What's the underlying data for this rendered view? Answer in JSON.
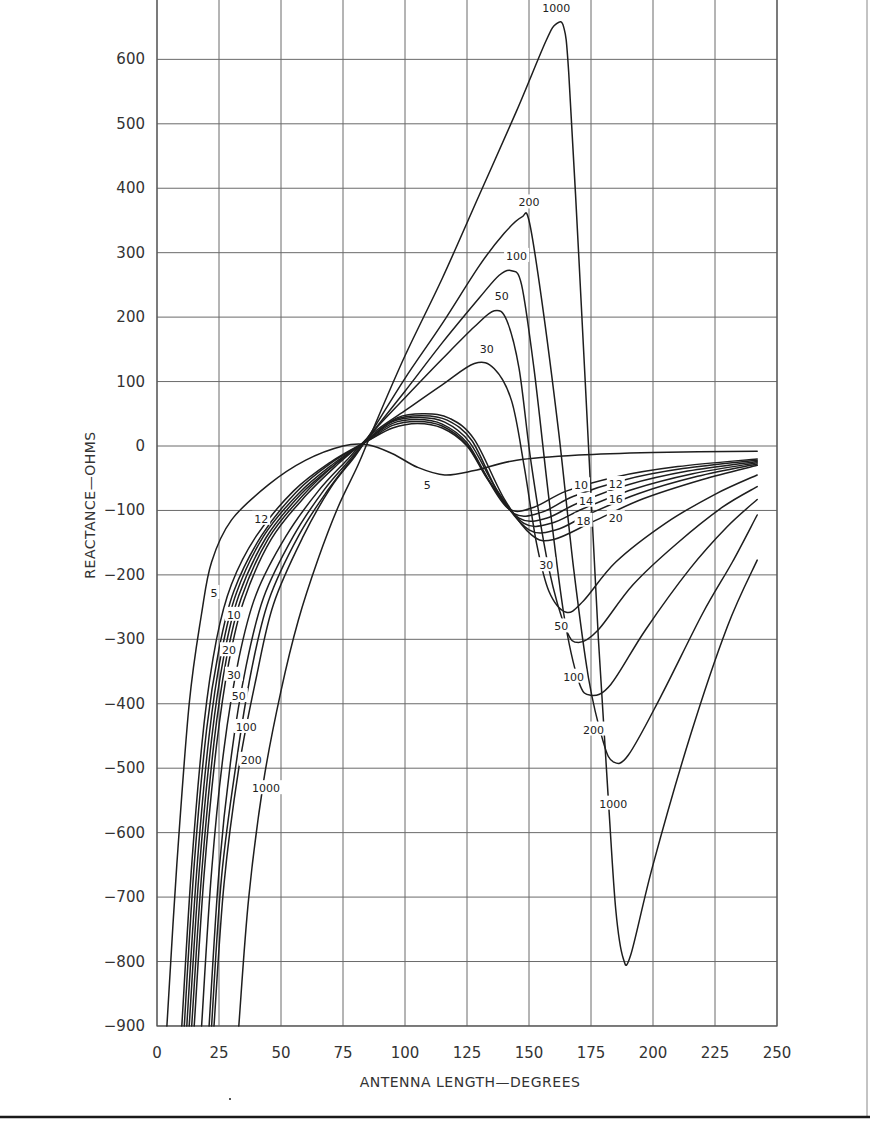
{
  "chart_data": {
    "type": "line",
    "title": "",
    "xlabel": "ANTENNA LENGTH—DEGREES",
    "ylabel": "REACTANCE—OHMS",
    "xlim": [
      0,
      250
    ],
    "ylim": [
      -900,
      700
    ],
    "grid": true,
    "legend": "inline curve labels",
    "x_ticks": [
      0,
      25,
      50,
      75,
      100,
      125,
      150,
      175,
      200,
      225,
      250
    ],
    "y_ticks": [
      700,
      600,
      500,
      400,
      300,
      200,
      100,
      0,
      -100,
      -200,
      -300,
      -400,
      -500,
      -600,
      -700,
      -800,
      -900
    ],
    "series": [
      {
        "name": "5",
        "points": [
          [
            4,
            -900
          ],
          [
            8,
            -650
          ],
          [
            13,
            -400
          ],
          [
            18,
            -260
          ],
          [
            22,
            -180
          ],
          [
            30,
            -115
          ],
          [
            45,
            -60
          ],
          [
            60,
            -22
          ],
          [
            75,
            0
          ],
          [
            85,
            2
          ],
          [
            95,
            -12
          ],
          [
            105,
            -33
          ],
          [
            116,
            -45
          ],
          [
            128,
            -38
          ],
          [
            145,
            -22
          ],
          [
            170,
            -14
          ],
          [
            200,
            -10
          ],
          [
            242,
            -8
          ]
        ]
      },
      {
        "name": "10",
        "points": [
          [
            10,
            -900
          ],
          [
            14,
            -650
          ],
          [
            19,
            -430
          ],
          [
            24,
            -300
          ],
          [
            30,
            -215
          ],
          [
            40,
            -140
          ],
          [
            55,
            -70
          ],
          [
            70,
            -25
          ],
          [
            85,
            8
          ],
          [
            95,
            28
          ],
          [
            105,
            35
          ],
          [
            115,
            28
          ],
          [
            125,
            0
          ],
          [
            133,
            -50
          ],
          [
            142,
            -98
          ],
          [
            152,
            -95
          ],
          [
            165,
            -70
          ],
          [
            185,
            -48
          ],
          [
            210,
            -32
          ],
          [
            242,
            -20
          ]
        ]
      },
      {
        "name": "12",
        "points": [
          [
            11,
            -900
          ],
          [
            15,
            -650
          ],
          [
            20,
            -440
          ],
          [
            25,
            -315
          ],
          [
            31,
            -225
          ],
          [
            42,
            -140
          ],
          [
            56,
            -72
          ],
          [
            70,
            -27
          ],
          [
            85,
            8
          ],
          [
            95,
            32
          ],
          [
            105,
            38
          ],
          [
            115,
            31
          ],
          [
            125,
            2
          ],
          [
            134,
            -55
          ],
          [
            144,
            -105
          ],
          [
            155,
            -103
          ],
          [
            168,
            -78
          ],
          [
            188,
            -53
          ],
          [
            212,
            -35
          ],
          [
            242,
            -22
          ]
        ]
      },
      {
        "name": "14",
        "points": [
          [
            12,
            -900
          ],
          [
            16,
            -660
          ],
          [
            21,
            -450
          ],
          [
            26,
            -320
          ],
          [
            32,
            -228
          ],
          [
            43,
            -140
          ],
          [
            57,
            -74
          ],
          [
            71,
            -28
          ],
          [
            85,
            9
          ],
          [
            95,
            35
          ],
          [
            105,
            41
          ],
          [
            115,
            34
          ],
          [
            125,
            5
          ],
          [
            135,
            -60
          ],
          [
            146,
            -112
          ],
          [
            157,
            -112
          ],
          [
            170,
            -88
          ],
          [
            190,
            -60
          ],
          [
            214,
            -39
          ],
          [
            242,
            -24
          ]
        ]
      },
      {
        "name": "16",
        "points": [
          [
            13,
            -900
          ],
          [
            17,
            -660
          ],
          [
            22,
            -455
          ],
          [
            27,
            -325
          ],
          [
            33,
            -232
          ],
          [
            44,
            -142
          ],
          [
            58,
            -75
          ],
          [
            72,
            -28
          ],
          [
            85,
            10
          ],
          [
            95,
            38
          ],
          [
            106,
            44
          ],
          [
            116,
            37
          ],
          [
            126,
            6
          ],
          [
            137,
            -68
          ],
          [
            148,
            -120
          ],
          [
            159,
            -120
          ],
          [
            172,
            -97
          ],
          [
            192,
            -67
          ],
          [
            216,
            -43
          ],
          [
            242,
            -26
          ]
        ]
      },
      {
        "name": "18",
        "points": [
          [
            14,
            -900
          ],
          [
            18,
            -665
          ],
          [
            23,
            -460
          ],
          [
            28,
            -330
          ],
          [
            34,
            -236
          ],
          [
            45,
            -143
          ],
          [
            59,
            -76
          ],
          [
            72,
            -28
          ],
          [
            85,
            10
          ],
          [
            96,
            41
          ],
          [
            107,
            47
          ],
          [
            117,
            40
          ],
          [
            127,
            8
          ],
          [
            138,
            -75
          ],
          [
            150,
            -130
          ],
          [
            161,
            -130
          ],
          [
            174,
            -106
          ],
          [
            194,
            -74
          ],
          [
            218,
            -47
          ],
          [
            242,
            -28
          ]
        ]
      },
      {
        "name": "20",
        "points": [
          [
            15,
            -900
          ],
          [
            19,
            -665
          ],
          [
            24,
            -465
          ],
          [
            29,
            -335
          ],
          [
            35,
            -240
          ],
          [
            46,
            -145
          ],
          [
            60,
            -77
          ],
          [
            73,
            -28
          ],
          [
            85,
            11
          ],
          [
            97,
            44
          ],
          [
            108,
            50
          ],
          [
            118,
            43
          ],
          [
            128,
            10
          ],
          [
            140,
            -82
          ],
          [
            151,
            -138
          ],
          [
            160,
            -145
          ],
          [
            176,
            -117
          ],
          [
            196,
            -82
          ],
          [
            220,
            -52
          ],
          [
            242,
            -30
          ]
        ]
      },
      {
        "name": "30",
        "points": [
          [
            18,
            -900
          ],
          [
            22,
            -660
          ],
          [
            27,
            -470
          ],
          [
            33,
            -330
          ],
          [
            40,
            -230
          ],
          [
            52,
            -140
          ],
          [
            65,
            -70
          ],
          [
            77,
            -20
          ],
          [
            87,
            20
          ],
          [
            100,
            55
          ],
          [
            115,
            95
          ],
          [
            128,
            128
          ],
          [
            136,
            120
          ],
          [
            143,
            70
          ],
          [
            148,
            -30
          ],
          [
            153,
            -150
          ],
          [
            158,
            -225
          ],
          [
            165,
            -258
          ],
          [
            172,
            -240
          ],
          [
            185,
            -180
          ],
          [
            205,
            -120
          ],
          [
            225,
            -75
          ],
          [
            242,
            -45
          ]
        ]
      },
      {
        "name": "50",
        "points": [
          [
            21,
            -900
          ],
          [
            25,
            -660
          ],
          [
            30,
            -480
          ],
          [
            36,
            -340
          ],
          [
            43,
            -235
          ],
          [
            55,
            -140
          ],
          [
            67,
            -70
          ],
          [
            78,
            -20
          ],
          [
            87,
            22
          ],
          [
            100,
            75
          ],
          [
            115,
            135
          ],
          [
            128,
            185
          ],
          [
            136,
            210
          ],
          [
            141,
            195
          ],
          [
            146,
            120
          ],
          [
            151,
            -30
          ],
          [
            158,
            -190
          ],
          [
            165,
            -285
          ],
          [
            170,
            -305
          ],
          [
            178,
            -285
          ],
          [
            192,
            -215
          ],
          [
            210,
            -150
          ],
          [
            228,
            -95
          ],
          [
            242,
            -63
          ]
        ]
      },
      {
        "name": "100",
        "points": [
          [
            22,
            -900
          ],
          [
            26,
            -670
          ],
          [
            32,
            -490
          ],
          [
            38,
            -350
          ],
          [
            45,
            -240
          ],
          [
            57,
            -140
          ],
          [
            69,
            -68
          ],
          [
            79,
            -18
          ],
          [
            87,
            22
          ],
          [
            100,
            85
          ],
          [
            115,
            160
          ],
          [
            130,
            230
          ],
          [
            138,
            265
          ],
          [
            143,
            272
          ],
          [
            147,
            250
          ],
          [
            152,
            120
          ],
          [
            158,
            -80
          ],
          [
            164,
            -260
          ],
          [
            170,
            -365
          ],
          [
            175,
            -387
          ],
          [
            183,
            -370
          ],
          [
            197,
            -285
          ],
          [
            215,
            -190
          ],
          [
            230,
            -125
          ],
          [
            242,
            -83
          ]
        ]
      },
      {
        "name": "200",
        "points": [
          [
            23,
            -900
          ],
          [
            27,
            -680
          ],
          [
            33,
            -500
          ],
          [
            40,
            -360
          ],
          [
            47,
            -245
          ],
          [
            59,
            -140
          ],
          [
            70,
            -65
          ],
          [
            80,
            -15
          ],
          [
            87,
            25
          ],
          [
            100,
            105
          ],
          [
            115,
            190
          ],
          [
            130,
            280
          ],
          [
            140,
            330
          ],
          [
            147,
            355
          ],
          [
            150,
            350
          ],
          [
            155,
            230
          ],
          [
            162,
            20
          ],
          [
            168,
            -190
          ],
          [
            174,
            -360
          ],
          [
            180,
            -460
          ],
          [
            184,
            -490
          ],
          [
            190,
            -480
          ],
          [
            203,
            -390
          ],
          [
            220,
            -260
          ],
          [
            232,
            -180
          ],
          [
            242,
            -107
          ]
        ]
      },
      {
        "name": "1000",
        "points": [
          [
            33,
            -900
          ],
          [
            37,
            -700
          ],
          [
            43,
            -520
          ],
          [
            50,
            -380
          ],
          [
            57,
            -270
          ],
          [
            65,
            -175
          ],
          [
            73,
            -95
          ],
          [
            81,
            -30
          ],
          [
            87,
            25
          ],
          [
            100,
            140
          ],
          [
            115,
            260
          ],
          [
            130,
            390
          ],
          [
            145,
            520
          ],
          [
            157,
            630
          ],
          [
            161,
            655
          ],
          [
            164,
            650
          ],
          [
            166,
            580
          ],
          [
            170,
            300
          ],
          [
            174,
            0
          ],
          [
            178,
            -300
          ],
          [
            182,
            -550
          ],
          [
            185,
            -720
          ],
          [
            188,
            -795
          ],
          [
            191,
            -790
          ],
          [
            200,
            -650
          ],
          [
            215,
            -450
          ],
          [
            230,
            -280
          ],
          [
            242,
            -177
          ]
        ]
      }
    ],
    "annotations": [
      {
        "text": "1000",
        "x": 161,
        "y": 680
      },
      {
        "text": "200",
        "x": 150,
        "y": 378
      },
      {
        "text": "100",
        "x": 145,
        "y": 295
      },
      {
        "text": "50",
        "x": 139,
        "y": 233
      },
      {
        "text": "30",
        "x": 133,
        "y": 150
      },
      {
        "text": "5",
        "x": 109,
        "y": -60
      },
      {
        "text": "10",
        "x": 171,
        "y": -61
      },
      {
        "text": "12",
        "x": 185,
        "y": -59
      },
      {
        "text": "14",
        "x": 173,
        "y": -85
      },
      {
        "text": "16",
        "x": 185,
        "y": -82
      },
      {
        "text": "18",
        "x": 172,
        "y": -116
      },
      {
        "text": "20",
        "x": 185,
        "y": -112
      },
      {
        "text": "30",
        "x": 157,
        "y": -185
      },
      {
        "text": "50",
        "x": 163,
        "y": -280
      },
      {
        "text": "100",
        "x": 168,
        "y": -358
      },
      {
        "text": "200",
        "x": 176,
        "y": -440
      },
      {
        "text": "1000",
        "x": 184,
        "y": -555
      },
      {
        "text": "5",
        "x": 23,
        "y": -228
      },
      {
        "text": "12",
        "x": 42,
        "y": -113
      },
      {
        "text": "10",
        "x": 31,
        "y": -262
      },
      {
        "text": "20",
        "x": 29,
        "y": -317
      },
      {
        "text": "30",
        "x": 31,
        "y": -355
      },
      {
        "text": "50",
        "x": 33,
        "y": -388
      },
      {
        "text": "100",
        "x": 36,
        "y": -436
      },
      {
        "text": "200",
        "x": 38,
        "y": -487
      },
      {
        "text": "1000",
        "x": 44,
        "y": -531
      }
    ]
  },
  "axes": {
    "x_title": "ANTENNA LENGTH—DEGREES",
    "y_title": "REACTANCE—OHMS"
  },
  "style": {
    "line_color": "#1e1e1e",
    "grid_color": "#6a6a6a",
    "background": "#ffffff"
  }
}
